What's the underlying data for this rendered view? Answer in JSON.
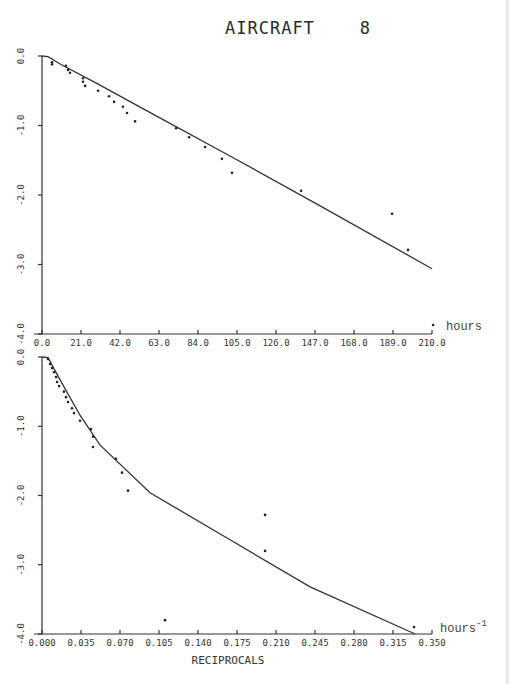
{
  "chart_data": [
    {
      "type": "scatter",
      "title": "AIRCRAFT    8",
      "xlabel": "hours",
      "ylabel": "",
      "xlim": [
        0.0,
        210.0
      ],
      "ylim": [
        -4.0,
        0.0
      ],
      "x_ticks": [
        "0.0",
        "21.0",
        "42.0",
        "63.0",
        "84.0",
        "105.0",
        "126.0",
        "147.0",
        "168.0",
        "189.0",
        "210.0"
      ],
      "y_ticks": [
        "0.0",
        "-1.0",
        "-2.0",
        "-3.0",
        "-4.0"
      ],
      "grid": false,
      "series": [
        {
          "name": "observed",
          "kind": "points",
          "x": [
            5.4,
            5.4,
            12.9,
            14.0,
            15.1,
            22.1,
            22.1,
            23.2,
            30.2,
            36.1,
            38.8,
            43.6,
            45.8,
            50.1,
            72.2,
            79.2,
            87.8,
            96.9,
            102.3,
            139.5,
            188.5,
            197.1,
            210.6
          ],
          "y": [
            -0.09,
            -0.12,
            -0.14,
            -0.2,
            -0.24,
            -0.32,
            -0.37,
            -0.43,
            -0.5,
            -0.58,
            -0.66,
            -0.73,
            -0.82,
            -0.94,
            -1.04,
            -1.17,
            -1.31,
            -1.48,
            -1.68,
            -1.94,
            -2.27,
            -2.79,
            -3.87
          ]
        },
        {
          "name": "fitted",
          "kind": "line",
          "x": [
            0.0,
            3.2,
            10.0,
            30.0,
            60.0,
            100.0,
            150.0,
            210.0
          ],
          "y": [
            0.0,
            -0.01,
            -0.12,
            -0.4,
            -0.84,
            -1.42,
            -2.16,
            -3.06
          ]
        }
      ]
    },
    {
      "type": "scatter",
      "title": "",
      "xlabel": "RECIPROCALS",
      "x_unit": "hours",
      "x_unit_exp": "-1",
      "ylabel": "",
      "xlim": [
        0.0,
        0.35
      ],
      "ylim": [
        -4.0,
        0.0
      ],
      "x_ticks": [
        "0.000",
        "0.035",
        "0.070",
        "0.105",
        "0.140",
        "0.175",
        "0.210",
        "0.245",
        "0.280",
        "0.315",
        "0.350"
      ],
      "y_ticks": [
        "0.0",
        "-1.0",
        "-2.0",
        "-3.0",
        "-4.0"
      ],
      "grid": false,
      "series": [
        {
          "name": "observed",
          "kind": "points",
          "x": [
            0.0054,
            0.0072,
            0.009,
            0.0108,
            0.0126,
            0.0135,
            0.0153,
            0.0197,
            0.0215,
            0.0233,
            0.0269,
            0.0287,
            0.0341,
            0.044,
            0.0458,
            0.0458,
            0.0664,
            0.0718,
            0.0772,
            0.2002,
            0.2002,
            0.1104,
            0.3339
          ],
          "y": [
            -0.03,
            -0.1,
            -0.16,
            -0.22,
            -0.29,
            -0.36,
            -0.42,
            -0.5,
            -0.58,
            -0.65,
            -0.74,
            -0.81,
            -0.92,
            -1.04,
            -1.15,
            -1.3,
            -1.47,
            -1.67,
            -1.93,
            -2.28,
            -2.8,
            -3.8,
            -3.9
          ]
        },
        {
          "name": "fitted",
          "kind": "line",
          "x": [
            0.0,
            0.0054,
            0.0162,
            0.0341,
            0.052,
            0.0969,
            0.1687,
            0.2406,
            0.3348
          ],
          "y": [
            0.0,
            -0.01,
            -0.33,
            -0.84,
            -1.27,
            -1.96,
            -2.64,
            -3.32,
            -4.0
          ]
        }
      ]
    }
  ],
  "figure": {
    "title": "AIRCRAFT    8",
    "top_unit_label": "hours",
    "bottom_unit_label": "hours",
    "bottom_unit_exp": "-1",
    "bottom_xlabel": "RECIPROCALS"
  }
}
